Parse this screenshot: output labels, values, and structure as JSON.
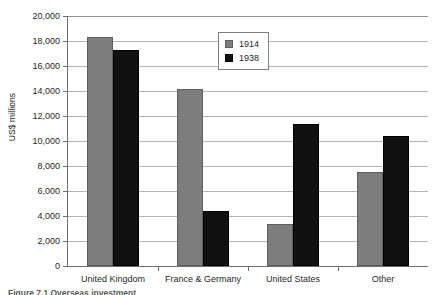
{
  "chart_data": {
    "type": "bar",
    "title": "",
    "xlabel": "",
    "ylabel": "US$ millions",
    "categories": [
      "United Kingdom",
      "France & Germany",
      "United States",
      "Other"
    ],
    "series": [
      {
        "name": "1914",
        "color": "#7d7d7d",
        "values": [
          18300,
          14150,
          3350,
          7500
        ]
      },
      {
        "name": "1938",
        "color": "#111111",
        "values": [
          17300,
          4400,
          11350,
          10400
        ]
      }
    ],
    "ylim": [
      0,
      20000
    ],
    "ytick_values": [
      20000,
      18000,
      16000,
      14000,
      12000,
      10000,
      8000,
      6000,
      4000,
      2000,
      0
    ],
    "ytick_labels": [
      "20,000",
      "18,000",
      "16,000",
      "14,000",
      "12,000",
      "10,000",
      "8,000",
      "6,000",
      "4,000",
      "2,000",
      "0"
    ],
    "grid": true,
    "grid_axis": "y",
    "legend": {
      "position": "upper-center",
      "boxed": true,
      "entries": [
        "1914",
        "1938"
      ]
    }
  },
  "caption": {
    "text": "Figure 7.1 Overseas investment"
  }
}
